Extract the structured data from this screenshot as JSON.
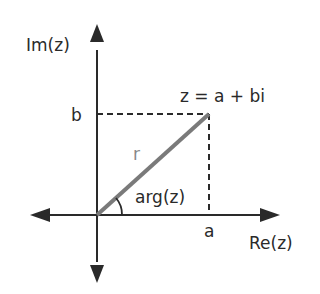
{
  "diagram": {
    "labels": {
      "imaginary_axis": "Im(z)",
      "real_axis": "Re(z)",
      "point": "z = a + bi",
      "imag_component": "b",
      "real_component": "a",
      "modulus": "r",
      "argument": "arg(z)"
    },
    "colors": {
      "axis": "#2a2a2a",
      "vector": "#7a7a7a",
      "dashed": "#2a2a2a",
      "text": "#2a2a2a",
      "modulus_label": "#888888"
    }
  }
}
